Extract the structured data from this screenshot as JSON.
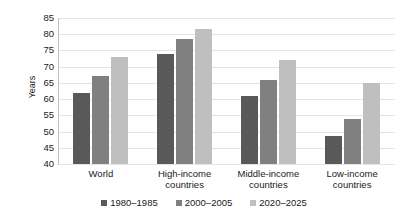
{
  "chart_data": {
    "type": "bar",
    "title": "",
    "subtitle": "",
    "xlabel": "",
    "ylabel": "Years",
    "ylim": [
      40,
      85
    ],
    "ytick_step": 5,
    "yticks": [
      85,
      80,
      75,
      70,
      65,
      60,
      55,
      50,
      45,
      40
    ],
    "grid": true,
    "legend_position": "bottom",
    "categories": [
      "World",
      "High-income countries",
      "Middle-income countries",
      "Low-income countries"
    ],
    "category_lines": [
      [
        "World"
      ],
      [
        "High-income",
        "countries"
      ],
      [
        "Middle-income",
        "countries"
      ],
      [
        "Low-income",
        "countries"
      ]
    ],
    "series": [
      {
        "name": "1980–1985",
        "color": "#595959",
        "values": [
          62,
          74,
          61,
          48.5
        ]
      },
      {
        "name": "2000–2005",
        "color": "#808080",
        "values": [
          67,
          78.5,
          66,
          54
        ]
      },
      {
        "name": "2020–2025",
        "color": "#bfbfbf",
        "values": [
          73,
          81.5,
          72,
          65
        ]
      }
    ]
  },
  "colors": {
    "series_1": "#595959",
    "series_2": "#808080",
    "series_3": "#bfbfbf",
    "gridline": "#e4e4e4",
    "axis": "#bfbfbf",
    "text": "#1a1a1a",
    "background": "#ffffff"
  }
}
